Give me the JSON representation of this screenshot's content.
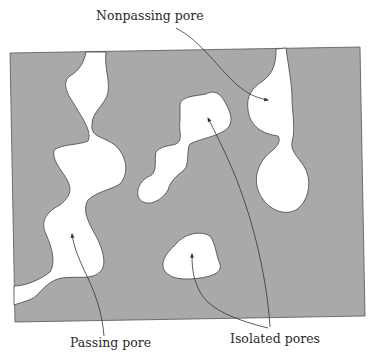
{
  "figure": {
    "type": "porous-medium-cross-section",
    "colors": {
      "solid_matrix": "#a9a9a9",
      "pore": "#ffffff",
      "outline": "#4a4a4a",
      "arrow": "#333333",
      "text": "#2a2a2a"
    }
  },
  "labels": {
    "nonpassing": "Nonpassing pore",
    "passing": "Passing pore",
    "isolated": "Isolated pores"
  }
}
